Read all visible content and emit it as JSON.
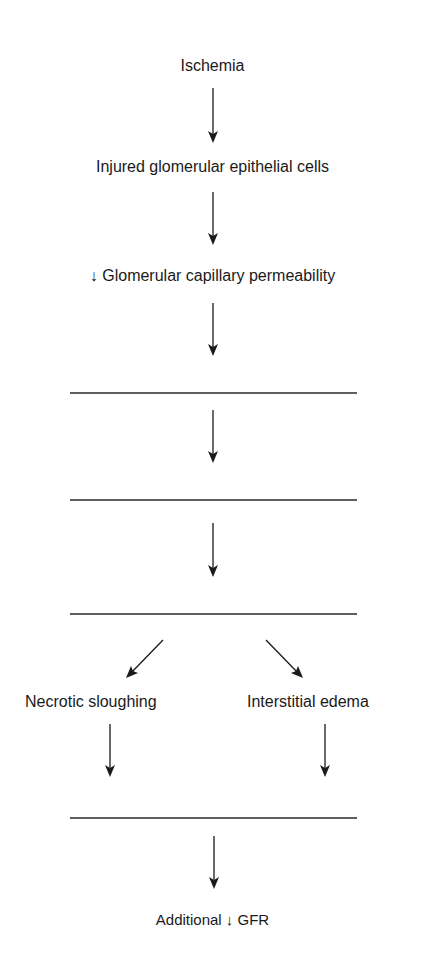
{
  "flowchart": {
    "nodes": {
      "ischemia": "Ischemia",
      "injured_cells": "Injured glomerular epithelial cells",
      "permeability": "↓ Glomerular capillary permeability",
      "blank_1": "",
      "blank_2": "",
      "blank_3": "",
      "necrotic": "Necrotic sloughing",
      "edema": "Interstitial edema",
      "blank_4": "",
      "final": "Additional ↓ GFR"
    },
    "edges": [
      {
        "from": "ischemia",
        "to": "injured_cells"
      },
      {
        "from": "injured_cells",
        "to": "permeability"
      },
      {
        "from": "permeability",
        "to": "blank_1"
      },
      {
        "from": "blank_1",
        "to": "blank_2"
      },
      {
        "from": "blank_2",
        "to": "blank_3"
      },
      {
        "from": "blank_3",
        "to": "necrotic"
      },
      {
        "from": "blank_3",
        "to": "edema"
      },
      {
        "from": "necrotic",
        "to": "blank_4"
      },
      {
        "from": "edema",
        "to": "blank_4"
      },
      {
        "from": "blank_4",
        "to": "final"
      }
    ]
  },
  "colors": {
    "background": "#ffffff",
    "ink": "#1a1a1a"
  }
}
